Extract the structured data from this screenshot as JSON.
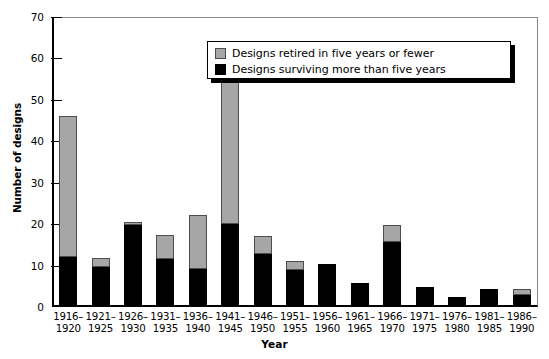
{
  "chart_data": {
    "type": "bar",
    "title": "",
    "subtitle": "",
    "xlabel": "Year",
    "ylabel": "Number of designs",
    "ylim": [
      0,
      70
    ],
    "yticks": [
      0,
      10,
      20,
      30,
      40,
      50,
      60,
      70
    ],
    "grid": false,
    "stacked": true,
    "legend_position": "top-right",
    "categories": [
      "1916–\n1920",
      "1921–\n1925",
      "1926–\n1930",
      "1931–\n1935",
      "1936–\n1940",
      "1941–\n1945",
      "1946–\n1950",
      "1951–\n1955",
      "1956–\n1960",
      "1961–\n1965",
      "1966–\n1970",
      "1971–\n1975",
      "1976–\n1980",
      "1981–\n1985",
      "1986–\n1990"
    ],
    "series": [
      {
        "name": "Designs surviving more than five years",
        "color": "#000000",
        "values": [
          12,
          9.7,
          19.9,
          11.6,
          9.2,
          20,
          12.9,
          9,
          10.4,
          5.8,
          15.8,
          4.9,
          2.4,
          4.4,
          2.9
        ]
      },
      {
        "name": "Designs retired in five years or fewer",
        "color": "#a6a6a6",
        "values": [
          34,
          2.2,
          0.5,
          5.9,
          12.9,
          37,
          4.3,
          2.2,
          0,
          0,
          4.1,
          0,
          0,
          0,
          1.5
        ]
      }
    ],
    "totals": [
      46,
      11.9,
      20.4,
      17.5,
      22.1,
      57,
      17.2,
      11.2,
      10.4,
      5.8,
      19.9,
      4.9,
      2.4,
      4.4,
      4.4
    ]
  },
  "legend": {
    "entries": [
      {
        "label": "Designs retired in five years or fewer",
        "swatch": "gray"
      },
      {
        "label": "Designs surviving more than five years",
        "swatch": "black"
      }
    ]
  }
}
